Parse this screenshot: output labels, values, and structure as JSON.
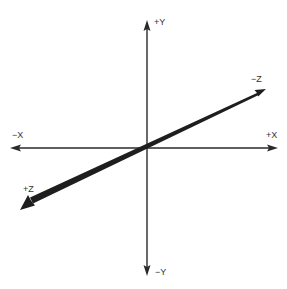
{
  "diagram": {
    "colors": {
      "axis": "#2a2a2a",
      "label": "#333333",
      "background": "#ffffff"
    },
    "origin": {
      "x": 147,
      "y": 148
    },
    "axes": [
      {
        "name": "x",
        "positive_label": "+X",
        "negative_label": "−X",
        "direction": "horizontal",
        "from": [
          10,
          148
        ],
        "to": [
          278,
          148
        ]
      },
      {
        "name": "y",
        "positive_label": "+Y",
        "negative_label": "−Y",
        "direction": "vertical",
        "from": [
          147,
          20
        ],
        "to": [
          147,
          275
        ]
      },
      {
        "name": "z",
        "positive_label": "+Z",
        "negative_label": "−Z",
        "direction": "diagonal-perspective",
        "from": [
          20,
          210
        ],
        "to": [
          266,
          89
        ],
        "note": "thick wedge toward +Z (viewer), thin toward −Z"
      }
    ],
    "labels": {
      "pos_y": "+Y",
      "neg_y": "−Y",
      "neg_x": "−X",
      "pos_x": "+X",
      "neg_z": "−Z",
      "pos_z": "+Z"
    }
  }
}
